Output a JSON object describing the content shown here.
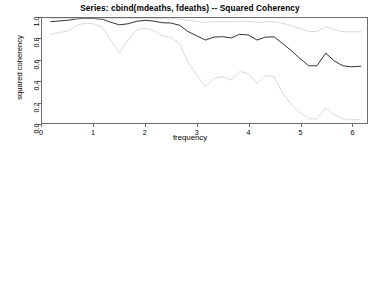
{
  "figure": {
    "background_color": "#ffffff",
    "line_color": "#1a1a1a",
    "band_color": "#c9c9c9",
    "axis_color": "#6d6d6d"
  },
  "panels": {
    "coherency": {
      "title": "Series: cbind(mdeaths, fdeaths)  --  Squared Coherency",
      "xlabel": "frequency",
      "ylabel": "squared coherency",
      "y_ticks": [
        "0.0",
        "0.2",
        "0.4",
        "0.6",
        "0.8",
        "1.0"
      ],
      "x_ticks": [
        "0",
        "1",
        "2",
        "3",
        "4",
        "5",
        "6"
      ]
    },
    "phase": {
      "title": "Series: cbind(mdeaths, fdeaths)  --  Phase spectrum",
      "xlabel": "frequency",
      "ylabel": "phase",
      "y_ticks": [
        "-3",
        "-2",
        "-1",
        "0",
        "1",
        "2",
        "3"
      ],
      "x_ticks": [
        "0",
        "1",
        "2",
        "3",
        "4",
        "5",
        "6"
      ]
    }
  },
  "chart_data": [
    {
      "type": "line",
      "id": "squared-coherency",
      "title": "Series: cbind(mdeaths, fdeaths)  --  Squared Coherency",
      "xlabel": "frequency",
      "ylabel": "squared coherency",
      "xlim": [
        0,
        6.3
      ],
      "ylim": [
        0.0,
        1.0
      ],
      "grid": false,
      "legend": "none",
      "x": [
        0.17,
        0.33,
        0.5,
        0.67,
        0.83,
        1.0,
        1.17,
        1.33,
        1.5,
        1.67,
        1.83,
        2.0,
        2.17,
        2.33,
        2.5,
        2.67,
        2.83,
        3.0,
        3.17,
        3.33,
        3.5,
        3.67,
        3.83,
        4.0,
        4.17,
        4.33,
        4.5,
        4.67,
        4.83,
        5.0,
        5.17,
        5.33,
        5.5,
        5.67,
        5.83,
        6.0,
        6.18
      ],
      "series": [
        {
          "name": "estimate",
          "style": "solid",
          "values": [
            0.965,
            0.972,
            0.978,
            0.992,
            0.996,
            0.995,
            0.988,
            0.96,
            0.935,
            0.945,
            0.968,
            0.978,
            0.97,
            0.955,
            0.952,
            0.93,
            0.872,
            0.83,
            0.79,
            0.818,
            0.822,
            0.81,
            0.845,
            0.838,
            0.79,
            0.818,
            0.82,
            0.755,
            0.69,
            0.615,
            0.545,
            0.545,
            0.665,
            0.59,
            0.545,
            0.535,
            0.54
          ]
        },
        {
          "name": "upper-confidence-bound",
          "style": "dotted",
          "values": [
            0.995,
            0.996,
            0.997,
            0.999,
            0.999,
            0.999,
            0.998,
            0.995,
            0.992,
            0.993,
            0.996,
            0.997,
            0.996,
            0.994,
            0.994,
            0.99,
            0.978,
            0.968,
            0.957,
            0.964,
            0.965,
            0.962,
            0.97,
            0.968,
            0.957,
            0.964,
            0.965,
            0.948,
            0.928,
            0.9,
            0.872,
            0.872,
            0.915,
            0.89,
            0.872,
            0.868,
            0.87
          ]
        },
        {
          "name": "lower-confidence-bound",
          "style": "dotted",
          "values": [
            0.845,
            0.86,
            0.875,
            0.93,
            0.95,
            0.945,
            0.91,
            0.79,
            0.67,
            0.79,
            0.885,
            0.905,
            0.88,
            0.83,
            0.815,
            0.755,
            0.58,
            0.455,
            0.345,
            0.425,
            0.44,
            0.41,
            0.49,
            0.47,
            0.375,
            0.455,
            0.44,
            0.28,
            0.18,
            0.1,
            0.04,
            0.04,
            0.145,
            0.075,
            0.04,
            0.03,
            0.035
          ]
        }
      ]
    },
    {
      "type": "line",
      "id": "phase-spectrum",
      "title": "Series: cbind(mdeaths, fdeaths)  --  Phase spectrum",
      "xlabel": "frequency",
      "ylabel": "phase",
      "xlim": [
        0,
        6.3
      ],
      "ylim": [
        -3.3,
        3.3
      ],
      "grid": false,
      "legend": "none",
      "x": [
        0.17,
        0.33,
        0.5,
        0.67,
        0.83,
        1.0,
        1.17,
        1.33,
        1.5,
        1.67,
        1.83,
        2.0,
        2.17,
        2.33,
        2.5,
        2.67,
        2.83,
        3.0,
        3.17,
        3.33,
        3.5,
        3.67,
        3.83,
        4.0,
        4.17,
        4.33,
        4.5,
        4.67,
        4.83,
        5.0,
        5.17,
        5.33,
        5.5,
        5.67,
        5.83,
        6.0,
        6.18
      ],
      "series": [
        {
          "name": "estimate",
          "style": "solid",
          "values": [
            0.13,
            0.12,
            0.1,
            0.07,
            0.05,
            0.04,
            0.04,
            0.05,
            0.06,
            0.08,
            0.1,
            0.11,
            0.1,
            0.08,
            0.05,
            0.0,
            -0.06,
            -0.12,
            -0.13,
            -0.08,
            0.0,
            0.07,
            0.1,
            0.06,
            -0.02,
            -0.06,
            -0.05,
            0.0,
            0.08,
            0.12,
            0.12,
            0.1,
            0.1,
            0.14,
            0.2,
            0.22,
            0.22
          ]
        },
        {
          "name": "upper-confidence-bound",
          "style": "dotted",
          "values": [
            0.3,
            0.28,
            0.25,
            0.2,
            0.15,
            0.13,
            0.14,
            0.17,
            0.22,
            0.24,
            0.24,
            0.24,
            0.24,
            0.24,
            0.24,
            0.22,
            0.2,
            0.2,
            0.24,
            0.3,
            0.36,
            0.4,
            0.4,
            0.36,
            0.3,
            0.28,
            0.3,
            0.38,
            0.48,
            0.55,
            0.55,
            0.52,
            0.56,
            0.68,
            0.8,
            0.82,
            0.8
          ]
        },
        {
          "name": "lower-confidence-bound",
          "style": "dotted",
          "values": [
            -0.04,
            -0.04,
            -0.05,
            -0.06,
            -0.05,
            -0.05,
            -0.06,
            -0.07,
            -0.1,
            -0.08,
            -0.04,
            -0.02,
            -0.04,
            -0.08,
            -0.14,
            -0.22,
            -0.32,
            -0.44,
            -0.5,
            -0.46,
            -0.36,
            -0.26,
            -0.2,
            -0.24,
            -0.34,
            -0.4,
            -0.4,
            -0.38,
            -0.32,
            -0.3,
            -0.31,
            -0.34,
            -0.36,
            -0.4,
            -0.4,
            -0.38,
            -0.36
          ]
        }
      ]
    }
  ]
}
